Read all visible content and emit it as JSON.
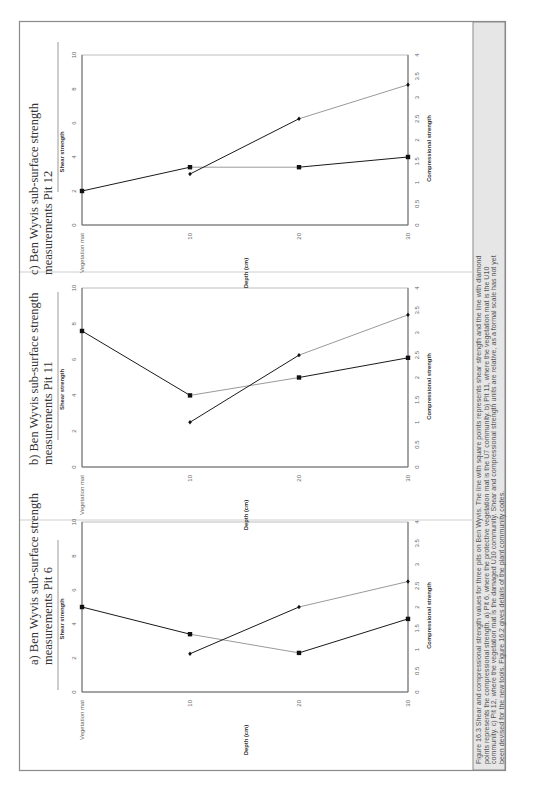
{
  "figure": {
    "caption_lines": [
      "Figure 16.3  Shear and compressional strength values for three pits on Ben Wyvis.  The line with square points represents shear strength and the line with diamond",
      "points represents the compressional strength.  a) Pit 6, where the protective vegetation mat is the U7 community.  b) Pit 11, where the vegetation mat is the U10",
      "community.  c) Pit 12, where the vegetation mat is the damaged U10 community.  Shear and compressional strength units are relative, as a formal scale has not yet",
      "been devised for the new tools.  Figure 16.2 gives details of the plant community codes."
    ],
    "colors": {
      "border": "#8a8a8a",
      "caption_bg": "#e6e6e6",
      "dark_line": "#1a1a1a",
      "light_line": "#9a9a9a",
      "axis": "#6a6a6a",
      "text": "#444444"
    }
  },
  "chart_data": [
    {
      "type": "line",
      "title": "a) Ben Wyvis sub-surface strength measurements Pit 6",
      "title_lines": [
        "a) Ben Wyvis sub-surface strength",
        "measurements Pit 6"
      ],
      "categories": [
        "Vegetation mat",
        "10",
        "20",
        "30"
      ],
      "xlabel": "Depth (cm)",
      "ylabel": "Shear strength",
      "y2label": "Compressional strength",
      "ylim": [
        0,
        10
      ],
      "y2lim": [
        0,
        4
      ],
      "yticks": [
        "0",
        "2",
        "4",
        "6",
        "8",
        "10"
      ],
      "y2ticks": [
        "0",
        "0.5",
        "1",
        "1.5",
        "2",
        "2.5",
        "3",
        "3.5",
        "4"
      ],
      "series": [
        {
          "name": "Shear strength",
          "marker": "square",
          "axis": "left",
          "values": [
            5.0,
            3.4,
            2.3,
            4.3
          ]
        },
        {
          "name": "Compressional strength",
          "marker": "diamond",
          "axis": "right",
          "values": [
            null,
            0.9,
            2.0,
            2.6
          ]
        }
      ]
    },
    {
      "type": "line",
      "title": "b) Ben Wyvis sub-surface strength measurements Pit 11",
      "title_lines": [
        "b) Ben Wyvis sub-surface strength",
        "measurements Pit 11"
      ],
      "categories": [
        "Vegetation mat",
        "10",
        "20",
        "30"
      ],
      "xlabel": "Depth (cm)",
      "ylabel": "Shear strength",
      "y2label": "Compressional strength",
      "ylim": [
        0,
        10
      ],
      "y2lim": [
        0,
        4
      ],
      "yticks": [
        "0",
        "2",
        "4",
        "6",
        "8",
        "10"
      ],
      "y2ticks": [
        "0",
        "0.5",
        "1",
        "1.5",
        "2",
        "2.5",
        "3",
        "3.5",
        "4"
      ],
      "series": [
        {
          "name": "Shear strength",
          "marker": "square",
          "axis": "left",
          "values": [
            7.6,
            4.0,
            5.0,
            6.1
          ]
        },
        {
          "name": "Compressional strength",
          "marker": "diamond",
          "axis": "right",
          "values": [
            null,
            1.0,
            2.5,
            3.4
          ]
        }
      ]
    },
    {
      "type": "line",
      "title": "c) Ben Wyvis sub-surface strength measurements Pit 12",
      "title_lines": [
        "c) Ben Wyvis sub-surface strength",
        "measurements Pit 12"
      ],
      "categories": [
        "Vegetation mat",
        "10",
        "20",
        "30"
      ],
      "xlabel": "Depth (cm)",
      "ylabel": "Shear strength",
      "y2label": "Compressional strength",
      "ylim": [
        0,
        10
      ],
      "y2lim": [
        0,
        4
      ],
      "yticks": [
        "0",
        "2",
        "4",
        "6",
        "8",
        "10"
      ],
      "y2ticks": [
        "0",
        "0.5",
        "1",
        "1.5",
        "2",
        "2.5",
        "3",
        "3.5",
        "4"
      ],
      "series": [
        {
          "name": "Shear strength",
          "marker": "square",
          "axis": "left",
          "values": [
            2.0,
            3.4,
            3.4,
            4.0
          ]
        },
        {
          "name": "Compressional strength",
          "marker": "diamond",
          "axis": "right",
          "values": [
            null,
            1.2,
            2.5,
            3.3
          ]
        }
      ]
    }
  ]
}
